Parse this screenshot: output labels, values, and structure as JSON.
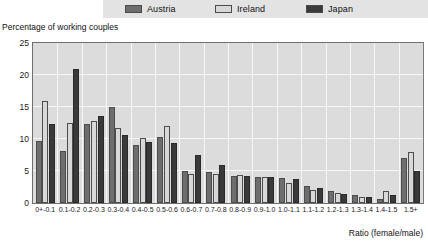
{
  "legend": {
    "items": [
      {
        "label": "Austria",
        "color": "#6e6e6e",
        "swatch_name": "legend-swatch-austria"
      },
      {
        "label": "Ireland",
        "color": "#d8d8d8",
        "swatch_name": "legend-swatch-ireland"
      },
      {
        "label": "Japan",
        "color": "#3a3a3a",
        "swatch_name": "legend-swatch-japan"
      }
    ]
  },
  "chart_data": {
    "type": "bar",
    "title": "",
    "subtitle": "",
    "xlabel": "Ratio (female/male)",
    "ylabel": "Percentage of working couples",
    "ylim": [
      0,
      25
    ],
    "yticks": [
      0,
      5,
      10,
      15,
      20,
      25
    ],
    "ytick_labels": [
      "0",
      "5",
      "10",
      "15",
      "20",
      "25"
    ],
    "grid": true,
    "legend_position": "top",
    "categories": [
      "0+-0.1",
      "0.1-0.2",
      "0.2-0.3",
      "0.3-0.4",
      "0.4-0.5",
      "0.5-0.6",
      "0.6-0.7",
      "0.7-0.8",
      "0.8-0.9",
      "0.9-1.0",
      "1.0-1.1",
      "1.1-1.2",
      "1.2-1.3",
      "1.3-1.4",
      "1.4-1.5",
      "1.5+"
    ],
    "series": [
      {
        "name": "Austria",
        "color": "#6e6e6e",
        "values": [
          9.7,
          8.2,
          12.3,
          15.0,
          9.1,
          10.3,
          5.0,
          4.8,
          4.2,
          4.1,
          3.9,
          2.6,
          1.8,
          1.3,
          0.6,
          7.0
        ]
      },
      {
        "name": "Ireland",
        "color": "#d8d8d8",
        "values": [
          16.0,
          12.5,
          12.8,
          11.7,
          10.2,
          12.0,
          4.5,
          4.6,
          4.3,
          4.0,
          3.2,
          2.1,
          1.5,
          1.0,
          1.9,
          8.0
        ]
      },
      {
        "name": "Japan",
        "color": "#3a3a3a",
        "values": [
          12.4,
          21.0,
          13.6,
          10.7,
          9.5,
          9.3,
          7.5,
          6.0,
          4.2,
          4.0,
          3.8,
          2.3,
          1.4,
          0.9,
          1.2,
          5.0
        ]
      }
    ]
  }
}
